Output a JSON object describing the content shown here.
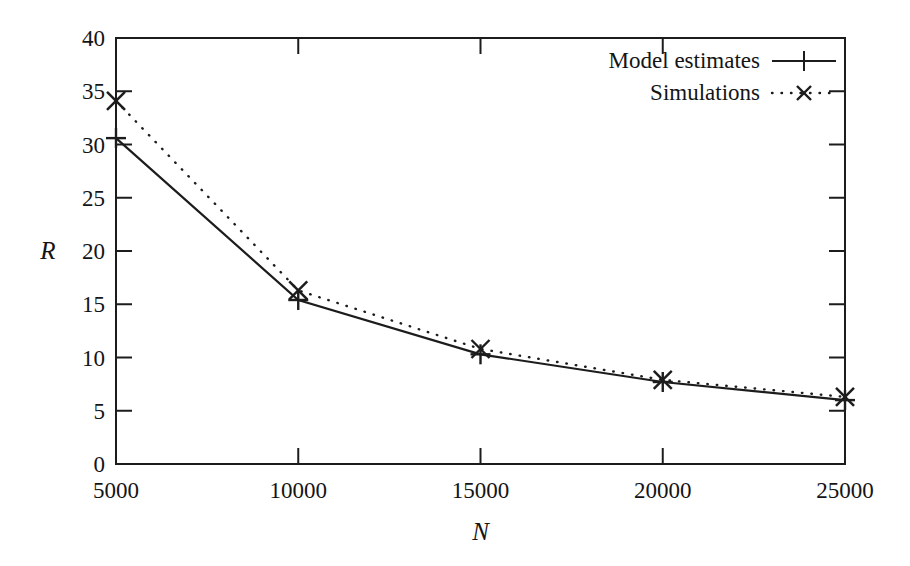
{
  "chart_data": {
    "type": "line",
    "title": "",
    "subtitle": "",
    "xlabel": "N",
    "ylabel": "R",
    "xlim": [
      5000,
      25000
    ],
    "ylim": [
      0,
      40
    ],
    "grid": false,
    "legend_position": "top-right",
    "x": [
      5000,
      10000,
      15000,
      20000,
      25000
    ],
    "xticklabels": [
      "5000",
      "10000",
      "15000",
      "20000",
      "25000"
    ],
    "yticks": [
      0,
      5,
      10,
      15,
      20,
      25,
      30,
      35,
      40
    ],
    "yticklabels": [
      "0",
      "5",
      "10",
      "15",
      "20",
      "25",
      "30",
      "35",
      "40"
    ],
    "series": [
      {
        "name": "Model estimates",
        "marker": "plus",
        "linestyle": "solid",
        "values": [
          30.6,
          15.4,
          10.3,
          7.7,
          6.0
        ]
      },
      {
        "name": "Simulations",
        "marker": "cross",
        "linestyle": "dotted",
        "values": [
          34.1,
          16.3,
          10.8,
          7.9,
          6.3
        ]
      }
    ]
  },
  "legend": {
    "entries": [
      {
        "label": "Model estimates",
        "sample": "solid-line-plus-marker"
      },
      {
        "label": "Simulations",
        "sample": "dotted-line-cross-marker"
      }
    ]
  },
  "axes": {
    "y_title": "R",
    "x_title": "N"
  },
  "colors": {
    "ink": "#1c1c1c",
    "background": "#ffffff"
  }
}
